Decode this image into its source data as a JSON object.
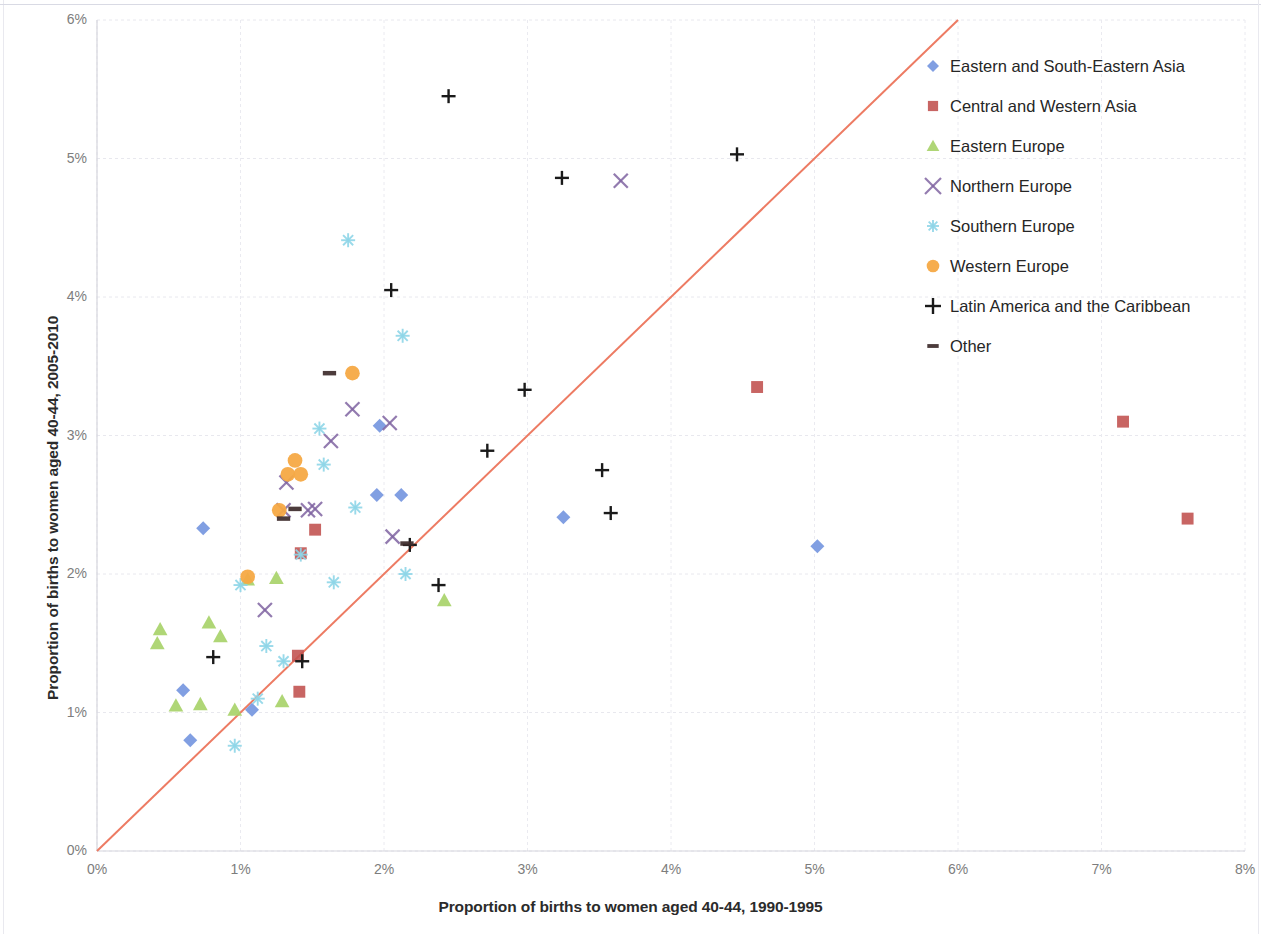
{
  "chart_data": {
    "type": "scatter",
    "title": "",
    "xlabel": "Proportion of births to women aged 40-44, 1990-1995",
    "ylabel": "Proportion of births to women aged 40-44, 2005-2010",
    "xlim": [
      0,
      8
    ],
    "ylim": [
      0,
      6
    ],
    "xticks": [
      "0%",
      "1%",
      "2%",
      "3%",
      "4%",
      "5%",
      "6%",
      "7%",
      "8%"
    ],
    "yticks": [
      "0%",
      "1%",
      "2%",
      "3%",
      "4%",
      "5%",
      "6%"
    ],
    "grid": true,
    "legend_position": "right",
    "units": "percent",
    "reference_line": {
      "name": "y = x diagonal",
      "color": "#ed7b63",
      "from": [
        0,
        0
      ],
      "to": [
        6.0,
        6.0
      ]
    },
    "series": [
      {
        "name": "Eastern and South-Eastern Asia",
        "marker": "diamond",
        "color": "#7a9ae0",
        "points": [
          [
            0.6,
            1.16
          ],
          [
            0.65,
            0.8
          ],
          [
            0.74,
            2.33
          ],
          [
            1.08,
            1.02
          ],
          [
            1.97,
            3.07
          ],
          [
            1.95,
            2.57
          ],
          [
            2.12,
            2.57
          ],
          [
            3.25,
            2.41
          ],
          [
            5.02,
            2.2
          ]
        ]
      },
      {
        "name": "Central and Western Asia",
        "marker": "square",
        "color": "#c0504d",
        "points": [
          [
            1.41,
            1.15
          ],
          [
            1.4,
            1.41
          ],
          [
            1.42,
            2.15
          ],
          [
            1.52,
            2.32
          ],
          [
            4.6,
            3.35
          ],
          [
            7.15,
            3.1
          ],
          [
            7.6,
            2.4
          ]
        ]
      },
      {
        "name": "Eastern Europe",
        "marker": "triangle",
        "color": "#a8d26a",
        "points": [
          [
            0.42,
            1.5
          ],
          [
            0.44,
            1.6
          ],
          [
            0.55,
            1.05
          ],
          [
            0.72,
            1.06
          ],
          [
            0.78,
            1.65
          ],
          [
            0.86,
            1.55
          ],
          [
            0.96,
            1.02
          ],
          [
            1.05,
            1.96
          ],
          [
            1.29,
            1.08
          ],
          [
            1.25,
            1.97
          ],
          [
            2.42,
            1.81
          ]
        ]
      },
      {
        "name": "Northern Europe",
        "marker": "x",
        "color": "#8064a2",
        "points": [
          [
            1.17,
            1.74
          ],
          [
            1.3,
            2.46
          ],
          [
            1.32,
            2.66
          ],
          [
            1.47,
            2.46
          ],
          [
            1.52,
            2.47
          ],
          [
            1.63,
            2.96
          ],
          [
            1.78,
            3.19
          ],
          [
            2.04,
            3.09
          ],
          [
            2.06,
            2.27
          ],
          [
            3.65,
            4.84
          ]
        ]
      },
      {
        "name": "Southern Europe",
        "marker": "asterisk",
        "color": "#8fd6e8",
        "points": [
          [
            0.96,
            0.76
          ],
          [
            1.0,
            1.92
          ],
          [
            1.12,
            1.1
          ],
          [
            1.18,
            1.48
          ],
          [
            1.3,
            1.37
          ],
          [
            1.42,
            2.14
          ],
          [
            1.55,
            3.05
          ],
          [
            1.58,
            2.79
          ],
          [
            1.65,
            1.94
          ],
          [
            1.75,
            4.41
          ],
          [
            1.8,
            2.48
          ],
          [
            2.13,
            3.72
          ],
          [
            2.15,
            2.0
          ]
        ]
      },
      {
        "name": "Western Europe",
        "marker": "circle",
        "color": "#f5a945",
        "points": [
          [
            1.05,
            1.98
          ],
          [
            1.27,
            2.46
          ],
          [
            1.33,
            2.72
          ],
          [
            1.38,
            2.82
          ],
          [
            1.42,
            2.72
          ],
          [
            1.78,
            3.45
          ]
        ]
      },
      {
        "name": "Latin America and the Caribbean",
        "marker": "plus",
        "color": "#1a1a1a",
        "points": [
          [
            0.81,
            1.4
          ],
          [
            1.43,
            1.37
          ],
          [
            2.05,
            4.05
          ],
          [
            2.18,
            2.21
          ],
          [
            2.38,
            1.92
          ],
          [
            2.45,
            5.45
          ],
          [
            2.72,
            2.89
          ],
          [
            2.98,
            3.33
          ],
          [
            3.24,
            4.86
          ],
          [
            3.52,
            2.75
          ],
          [
            3.58,
            2.44
          ],
          [
            4.46,
            5.03
          ]
        ]
      },
      {
        "name": "Other",
        "marker": "dash",
        "color": "#3d2b2b",
        "points": [
          [
            1.3,
            2.4
          ],
          [
            1.38,
            2.47
          ],
          [
            1.62,
            3.45
          ],
          [
            2.16,
            2.22
          ]
        ]
      }
    ]
  },
  "legend": {
    "items": [
      {
        "label": "Eastern and South-Eastern Asia",
        "marker": "diamond-marker-icon",
        "color": "#7a9ae0"
      },
      {
        "label": "Central and Western Asia",
        "marker": "square-marker-icon",
        "color": "#c0504d"
      },
      {
        "label": "Eastern Europe",
        "marker": "triangle-marker-icon",
        "color": "#a8d26a"
      },
      {
        "label": "Northern Europe",
        "marker": "x-marker-icon",
        "color": "#8064a2"
      },
      {
        "label": "Southern Europe",
        "marker": "asterisk-marker-icon",
        "color": "#8fd6e8"
      },
      {
        "label": "Western Europe",
        "marker": "circle-marker-icon",
        "color": "#f5a945"
      },
      {
        "label": "Latin America and the Caribbean",
        "marker": "plus-marker-icon",
        "color": "#1a1a1a"
      },
      {
        "label": "Other",
        "marker": "dash-marker-icon",
        "color": "#3d2b2b"
      }
    ]
  }
}
